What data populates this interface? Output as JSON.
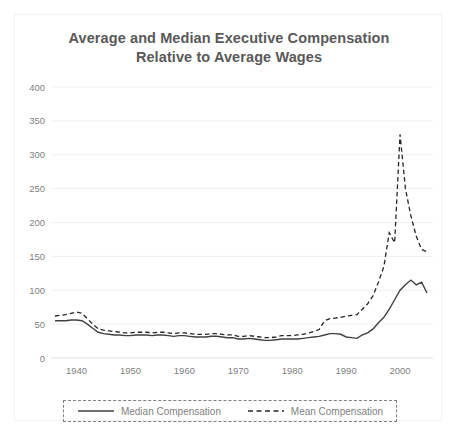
{
  "chart_data": {
    "type": "line",
    "title": "Average and Median Executive Compensation Relative to Average Wages",
    "title_line1": "Average and Median Executive Compensation",
    "title_line2": "Relative to Average Wages",
    "xlabel": "",
    "ylabel": "",
    "xlim": [
      1936,
      2005
    ],
    "ylim": [
      0,
      400
    ],
    "ytick_values": [
      0,
      50,
      100,
      150,
      200,
      250,
      300,
      350,
      400
    ],
    "ytick_labels": [
      "0",
      "50",
      "100",
      "150",
      "200",
      "250",
      "300",
      "350",
      "400"
    ],
    "xtick_values": [
      1940,
      1950,
      1960,
      1970,
      1980,
      1990,
      2000
    ],
    "xtick_labels": [
      "1940",
      "1950",
      "1960",
      "1970",
      "1980",
      "1990",
      "2000"
    ],
    "grid": "horizontal",
    "legend_position": "bottom",
    "x": [
      1936,
      1937,
      1938,
      1939,
      1940,
      1941,
      1942,
      1943,
      1944,
      1945,
      1946,
      1947,
      1948,
      1949,
      1950,
      1951,
      1952,
      1953,
      1954,
      1955,
      1956,
      1957,
      1958,
      1959,
      1960,
      1961,
      1962,
      1963,
      1964,
      1965,
      1966,
      1967,
      1968,
      1969,
      1970,
      1971,
      1972,
      1973,
      1974,
      1975,
      1976,
      1977,
      1978,
      1979,
      1980,
      1981,
      1982,
      1983,
      1984,
      1985,
      1986,
      1987,
      1988,
      1989,
      1990,
      1991,
      1992,
      1993,
      1994,
      1995,
      1996,
      1997,
      1998,
      1999,
      2000,
      2001,
      2002,
      2003,
      2004,
      2005
    ],
    "series": [
      {
        "name": "Median Compensation",
        "style": "solid",
        "color": "#404040",
        "values": [
          55,
          55,
          55,
          56,
          56,
          55,
          50,
          44,
          38,
          36,
          35,
          34,
          34,
          33,
          33,
          34,
          34,
          34,
          33,
          34,
          34,
          33,
          32,
          33,
          33,
          32,
          31,
          31,
          31,
          32,
          32,
          31,
          30,
          30,
          28,
          28,
          29,
          28,
          27,
          26,
          26,
          27,
          28,
          28,
          28,
          28,
          29,
          30,
          31,
          32,
          34,
          36,
          36,
          35,
          31,
          30,
          29,
          34,
          37,
          43,
          52,
          60,
          72,
          86,
          100,
          108,
          115,
          108,
          112,
          96
        ]
      },
      {
        "name": "Mean Compensation",
        "style": "dashed",
        "color": "#262626",
        "values": [
          62,
          63,
          64,
          66,
          68,
          66,
          58,
          50,
          43,
          41,
          40,
          39,
          38,
          37,
          37,
          38,
          38,
          38,
          37,
          38,
          38,
          37,
          36,
          37,
          37,
          36,
          35,
          35,
          35,
          36,
          36,
          35,
          34,
          34,
          32,
          32,
          33,
          32,
          31,
          30,
          30,
          31,
          33,
          33,
          33,
          34,
          35,
          37,
          39,
          42,
          55,
          58,
          59,
          60,
          62,
          63,
          64,
          72,
          80,
          92,
          112,
          135,
          185,
          170,
          330,
          250,
          210,
          180,
          160,
          157
        ]
      }
    ]
  },
  "legend": {
    "entries": [
      {
        "label": "Median Compensation",
        "style": "solid"
      },
      {
        "label": "Mean Compensation",
        "style": "dashed"
      }
    ]
  }
}
